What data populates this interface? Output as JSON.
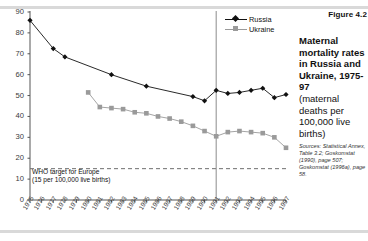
{
  "figure": {
    "number": "Figure 4.2",
    "title_lines": "Maternal\nmortality rates\nin Russia\nand Ukraine,\n1975-97",
    "subtitle_lines": "(maternal\ndeaths\nper 100,000\nlive births)",
    "sources": "Sources: Statistical Annex, Table 3.2; Goskomstat (1990), page 507; Goskomstat (1996a), page 58."
  },
  "annotation": {
    "who_target": "WHO target for Europe\n(15 per 100,000 live births)",
    "who_target_value": 15
  },
  "legend": {
    "position": "top-right",
    "entries": [
      {
        "label": "Russia",
        "color": "#111111",
        "marker": "diamond"
      },
      {
        "label": "Ukraine",
        "color": "#9a9a9a",
        "marker": "square"
      }
    ]
  },
  "colors": {
    "russia": "#111111",
    "ukraine": "#9a9a9a",
    "axis": "#555555",
    "divider": "#8c8c8c",
    "rule": "#d9d9d9"
  },
  "chart_data": {
    "type": "line",
    "title": "Maternal mortality rates in Russia and Ukraine, 1975-97",
    "xlabel": "",
    "ylabel": "maternal deaths per 100,000 live births",
    "ylim": [
      0,
      90
    ],
    "ytick_step": 10,
    "yticks": [
      0,
      10,
      20,
      30,
      40,
      50,
      60,
      70,
      80,
      90
    ],
    "grid": false,
    "x": [
      1975,
      1976,
      1977,
      1978,
      1979,
      1980,
      1981,
      1982,
      1983,
      1984,
      1985,
      1986,
      1987,
      1988,
      1989,
      1990,
      1991,
      1992,
      1993,
      1994,
      1995,
      1996,
      1997
    ],
    "xtick_labels": [
      "1975",
      "1976",
      "1977",
      "1978",
      "1979",
      "1980",
      "1981",
      "1982",
      "1983",
      "1984",
      "1985",
      "1986",
      "1987",
      "1988",
      "1989",
      "1990",
      "1991",
      "1992",
      "1993",
      "1994",
      "1995",
      "1996",
      "1997"
    ],
    "series": [
      {
        "name": "Russia",
        "color": "#111111",
        "marker": "diamond",
        "values": [
          86,
          null,
          72.5,
          68.5,
          null,
          null,
          null,
          60,
          null,
          null,
          54.5,
          null,
          null,
          null,
          49.5,
          47.5,
          52.5,
          51,
          51.5,
          52.5,
          53.5,
          49,
          50.5
        ],
        "marker_years": [
          1975,
          1977,
          1978,
          1982,
          1985,
          1989,
          1990,
          1991,
          1992,
          1993,
          1994,
          1995,
          1996,
          1997
        ]
      },
      {
        "name": "Ukraine",
        "color": "#9a9a9a",
        "marker": "square",
        "values": [
          null,
          null,
          null,
          null,
          null,
          51.5,
          44.5,
          44,
          43.5,
          42,
          41.5,
          40,
          39,
          37.5,
          35.5,
          33,
          30.5,
          32.5,
          33,
          32.5,
          32,
          30,
          25
        ],
        "marker_years": [
          1980,
          1981,
          1982,
          1983,
          1984,
          1985,
          1986,
          1987,
          1988,
          1989,
          1990,
          1991,
          1992,
          1993,
          1994,
          1995,
          1996,
          1997
        ]
      }
    ],
    "reference_lines": [
      {
        "orientation": "horizontal",
        "value": 15,
        "style": "dashed",
        "label": "WHO target for Europe (15 per 100,000 live births)"
      },
      {
        "orientation": "vertical",
        "value": 1991,
        "style": "solid",
        "label": ""
      }
    ]
  }
}
